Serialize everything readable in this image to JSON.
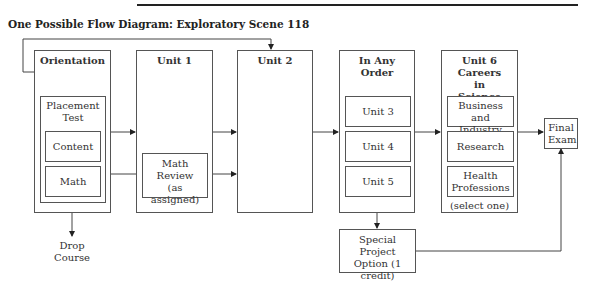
{
  "diagram": {
    "title": "One Possible Flow Diagram: Exploratory Scene 118",
    "stages": {
      "orientation": {
        "label": "Orientation",
        "placement_test": {
          "label": "Placement Test",
          "items": [
            "Content",
            "Math"
          ]
        }
      },
      "unit1": {
        "label": "Unit 1",
        "math_review": "Math Review (as assigned)"
      },
      "unit2": {
        "label": "Unit 2"
      },
      "any_order": {
        "label": "In Any Order",
        "units": [
          "Unit 3",
          "Unit 4",
          "Unit 5"
        ]
      },
      "unit6": {
        "label_line1": "Unit 6",
        "label_line2": "Careers in Science",
        "options": [
          "Business and Industry",
          "Research",
          "Health Professions"
        ],
        "note": "(select one)"
      },
      "final_exam": "Final Exam",
      "special_project": "Special Project Option (1 credit)",
      "drop_course": "Drop Course"
    },
    "edges": [
      {
        "from": "Orientation",
        "to": "Unit 2",
        "type": "loop-over-top"
      },
      {
        "from": "Content",
        "to": "Unit 1"
      },
      {
        "from": "Math",
        "to": "Math Review (as assigned)"
      },
      {
        "from": "Math",
        "to": "Drop Course"
      },
      {
        "from": "Unit 1",
        "to": "Unit 2"
      },
      {
        "from": "Math Review (as assigned)",
        "to": "Unit 2"
      },
      {
        "from": "Unit 2",
        "to": "In Any Order"
      },
      {
        "from": "In Any Order",
        "to": "Unit 6"
      },
      {
        "from": "Unit 5",
        "to": "Special Project Option (1 credit)"
      },
      {
        "from": "Unit 6",
        "to": "Final Exam"
      },
      {
        "from": "Special Project Option (1 credit)",
        "to": "Final Exam"
      }
    ],
    "colors": {
      "line": "#333333",
      "background": "#ffffff"
    }
  }
}
